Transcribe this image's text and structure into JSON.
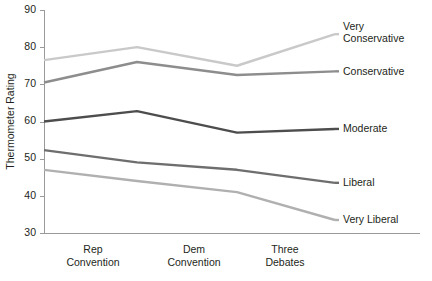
{
  "chart_data": {
    "type": "line",
    "title": "",
    "xlabel": "",
    "ylabel": "Thermometer Rating",
    "categories": [
      "Baseline",
      "Rep Convention",
      "Dem Convention",
      "Three Debates"
    ],
    "x_tick_labels": [
      {
        "line1": "Rep",
        "line2": "Convention"
      },
      {
        "line1": "Dem",
        "line2": "Convention"
      },
      {
        "line1": "Three",
        "line2": "Debates"
      }
    ],
    "ylim": [
      30,
      90
    ],
    "y_ticks": [
      30,
      40,
      50,
      60,
      70,
      80,
      90
    ],
    "grid": false,
    "legend_position": "right-inline",
    "series": [
      {
        "name": "Very Conservative",
        "label_line1": "Very",
        "label_line2": "Conservative",
        "color": "#c9c9c9",
        "values": [
          76.5,
          80.0,
          75.0,
          83.5
        ]
      },
      {
        "name": "Conservative",
        "label_line1": "Conservative",
        "label_line2": "",
        "color": "#8d8d8d",
        "values": [
          70.5,
          76.0,
          72.5,
          73.5
        ]
      },
      {
        "name": "Moderate",
        "label_line1": "Moderate",
        "label_line2": "",
        "color": "#4d4d4d",
        "values": [
          60.0,
          62.8,
          57.0,
          58.0
        ]
      },
      {
        "name": "Liberal",
        "label_line1": "Liberal",
        "label_line2": "",
        "color": "#6e6e6e",
        "values": [
          52.3,
          49.0,
          47.0,
          43.5
        ]
      },
      {
        "name": "Very Liberal",
        "label_line1": "Very Liberal",
        "label_line2": "",
        "color": "#b0b0b0",
        "values": [
          47.0,
          44.0,
          41.0,
          33.5
        ]
      }
    ],
    "axis_color": "#9a9a9a",
    "text_color": "#231f20"
  },
  "geometry": {
    "plot_left": 44,
    "plot_right": 335,
    "plot_top": 10,
    "plot_bottom": 233,
    "x_points": [
      44,
      137,
      237,
      335
    ],
    "x_label_positions": [
      93,
      194,
      285
    ],
    "legend_x": 343
  }
}
